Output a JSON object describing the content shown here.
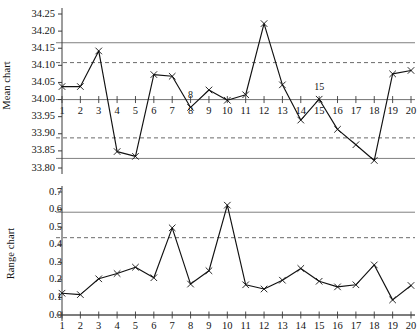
{
  "figure": {
    "kind": "spc-control-chart-pair"
  },
  "mean_panel": {
    "axis_title": "Mean chart",
    "y_ticks": [
      "34.25",
      "34.20",
      "34.15",
      "34.10",
      "34.05",
      "34.00",
      "33.95",
      "33.90",
      "33.85",
      "33.80"
    ],
    "annotations": [
      {
        "label": "8",
        "sample": 8
      },
      {
        "label": "15",
        "sample": 15
      }
    ]
  },
  "range_panel": {
    "axis_title": "Range chart",
    "y_ticks": [
      "0.7",
      "0.6",
      "0.5",
      "0.4",
      "0.3",
      "0.2",
      "0.1",
      "0.0"
    ],
    "x_ticks": [
      "1",
      "2",
      "3",
      "4",
      "5",
      "6",
      "7",
      "8",
      "9",
      "10",
      "11",
      "12",
      "13",
      "14",
      "15",
      "16",
      "17",
      "18",
      "19",
      "20"
    ]
  },
  "colors": {
    "data_line": "#111111",
    "marker": "#111111",
    "action_limit": "#808080",
    "warning_limit": "#5a5a5a",
    "centerline": "#808080",
    "axis": "#3a3a3a",
    "text": "#141414",
    "background": "#ffffff"
  },
  "chart_data": [
    {
      "type": "line",
      "title": "Mean chart",
      "xlabel": "",
      "ylabel": "Mean chart",
      "x": [
        1,
        2,
        3,
        4,
        5,
        6,
        7,
        8,
        9,
        10,
        11,
        12,
        13,
        14,
        15,
        16,
        17,
        18,
        19,
        20
      ],
      "xticklabels": [
        "1",
        "2",
        "3",
        "4",
        "5",
        "6",
        "7",
        "8",
        "9",
        "10",
        "11",
        "12",
        "13",
        "14",
        "15",
        "16",
        "17",
        "18",
        "19",
        "20"
      ],
      "values": [
        34.038,
        34.038,
        34.142,
        33.848,
        33.834,
        34.073,
        34.068,
        33.977,
        34.028,
        33.998,
        34.014,
        34.222,
        34.043,
        33.94,
        34.001,
        33.913,
        33.868,
        33.822,
        34.075,
        34.085
      ],
      "ylim": [
        33.8,
        34.25
      ],
      "yticks": [
        33.8,
        33.85,
        33.9,
        33.95,
        34.0,
        34.05,
        34.1,
        34.15,
        34.2,
        34.25
      ],
      "yticklabels": [
        "33.80",
        "33.85",
        "33.90",
        "33.95",
        "34.00",
        "34.05",
        "34.10",
        "34.15",
        "34.20",
        "34.25"
      ],
      "grid": false,
      "legend": "none",
      "reference_lines": [
        {
          "name": "upper action limit",
          "value": 34.166,
          "style": "solid"
        },
        {
          "name": "upper warning limit",
          "value": 34.108,
          "style": "dashed"
        },
        {
          "name": "centre line",
          "value": 34.0,
          "style": "solid"
        },
        {
          "name": "lower warning limit",
          "value": 33.888,
          "style": "dashed"
        },
        {
          "name": "lower action limit",
          "value": 33.828,
          "style": "solid"
        }
      ],
      "annotations": [
        {
          "text": "8",
          "x": 8,
          "y": 33.977
        },
        {
          "text": "15",
          "x": 15,
          "y": 34.001
        }
      ]
    },
    {
      "type": "line",
      "title": "Range chart",
      "xlabel": "",
      "ylabel": "Range chart",
      "x": [
        1,
        2,
        3,
        4,
        5,
        6,
        7,
        8,
        9,
        10,
        11,
        12,
        13,
        14,
        15,
        16,
        17,
        18,
        19,
        20
      ],
      "xticklabels": [
        "1",
        "2",
        "3",
        "4",
        "5",
        "6",
        "7",
        "8",
        "9",
        "10",
        "11",
        "12",
        "13",
        "14",
        "15",
        "16",
        "17",
        "18",
        "19",
        "20"
      ],
      "values": [
        0.124,
        0.116,
        0.206,
        0.236,
        0.272,
        0.212,
        0.496,
        0.176,
        0.252,
        0.625,
        0.172,
        0.148,
        0.198,
        0.265,
        0.192,
        0.16,
        0.172,
        0.285,
        0.086,
        0.168
      ],
      "ylim": [
        0.0,
        0.7
      ],
      "yticks": [
        0.0,
        0.1,
        0.2,
        0.3,
        0.4,
        0.5,
        0.6,
        0.7
      ],
      "yticklabels": [
        "0.0",
        "0.1",
        "0.2",
        "0.3",
        "0.4",
        "0.5",
        "0.6",
        "0.7"
      ],
      "grid": false,
      "legend": "none",
      "reference_lines": [
        {
          "name": "upper action limit",
          "value": 0.585,
          "style": "solid"
        },
        {
          "name": "upper warning limit",
          "value": 0.44,
          "style": "dashed"
        },
        {
          "name": "baseline",
          "value": 0.0,
          "style": "solid"
        }
      ]
    }
  ]
}
